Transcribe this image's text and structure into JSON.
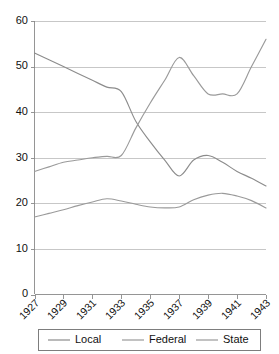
{
  "chart_data": {
    "type": "line",
    "title": "",
    "xlabel": "",
    "ylabel": "",
    "x": [
      1927,
      1928,
      1929,
      1930,
      1931,
      1932,
      1933,
      1934,
      1935,
      1936,
      1937,
      1938,
      1939,
      1940,
      1941,
      1942,
      1943
    ],
    "tick_labels": [
      "1927",
      "1929",
      "1931",
      "1933",
      "1935",
      "1937",
      "1939",
      "1941",
      "1943"
    ],
    "xlim": [
      1927,
      1943
    ],
    "ylim": [
      0,
      60
    ],
    "yticks": [
      0,
      10,
      20,
      30,
      40,
      50,
      60
    ],
    "ytick_labels": [
      "0",
      "10",
      "20",
      "30",
      "40",
      "50",
      "60"
    ],
    "grid": true,
    "legend_position": "bottom",
    "series": [
      {
        "name": "Local",
        "color": "#8c8c8c",
        "values": [
          53.0,
          51.5,
          50.0,
          48.5,
          47.0,
          45.5,
          44.5,
          38.0,
          33.5,
          29.5,
          26.0,
          29.5,
          30.5,
          29.0,
          27.0,
          25.5,
          23.8
        ]
      },
      {
        "name": "Federal",
        "color": "#9a9a9a",
        "values": [
          27.0,
          28.0,
          29.0,
          29.5,
          30.0,
          30.3,
          30.5,
          36.5,
          42.0,
          47.0,
          52.0,
          48.0,
          44.0,
          44.0,
          44.0,
          50.0,
          56.0
        ]
      },
      {
        "name": "State",
        "color": "#9a9a9a",
        "values": [
          17.0,
          17.8,
          18.6,
          19.5,
          20.3,
          21.0,
          20.5,
          19.8,
          19.2,
          19.0,
          19.2,
          20.8,
          21.8,
          22.2,
          21.6,
          20.6,
          19.0
        ]
      }
    ]
  },
  "legend": {
    "items": [
      {
        "label": "Local"
      },
      {
        "label": "Federal"
      },
      {
        "label": "State"
      }
    ]
  },
  "axes": {
    "y_labels": [
      "60",
      "50",
      "40",
      "30",
      "20",
      "10",
      "0"
    ],
    "x_labels": [
      "1927",
      "1929",
      "1931",
      "1933",
      "1935",
      "1937",
      "1939",
      "1941",
      "1943"
    ]
  }
}
